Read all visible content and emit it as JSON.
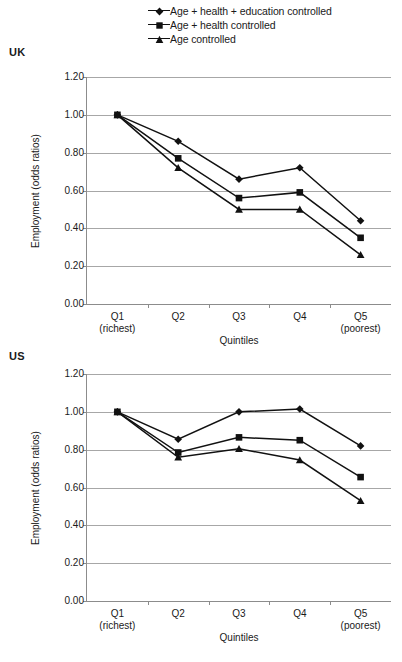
{
  "legend": {
    "position": "top-center",
    "items": [
      {
        "label": "Age + health + education controlled",
        "marker": "diamond-marker"
      },
      {
        "label": "Age + health controlled",
        "marker": "square-marker"
      },
      {
        "label": "Age controlled",
        "marker": "triangle-marker"
      }
    ]
  },
  "panels": [
    {
      "tag": "UK",
      "id": "uk"
    },
    {
      "tag": "US",
      "id": "us"
    }
  ],
  "axis": {
    "ylabel": "Employment (odds ratios)",
    "xlabel": "Quintiles",
    "yticks": [
      "1.20",
      "1.00",
      "0.80",
      "0.60",
      "0.40",
      "0.20",
      "0.00"
    ],
    "xticks": [
      {
        "main": "Q1",
        "sub": "(richest)"
      },
      {
        "main": "Q2",
        "sub": ""
      },
      {
        "main": "Q3",
        "sub": ""
      },
      {
        "main": "Q4",
        "sub": ""
      },
      {
        "main": "Q5",
        "sub": "(poorest)"
      }
    ]
  },
  "colors": {
    "line": "#111111",
    "grid": "#a7a7a7",
    "axis": "#8c8c8c",
    "text": "#1a1a1a"
  },
  "chart_data": [
    {
      "type": "line",
      "title": "UK",
      "xlabel": "Quintiles",
      "ylabel": "Employment (odds ratios)",
      "categories": [
        "Q1 (richest)",
        "Q2",
        "Q3",
        "Q4",
        "Q5 (poorest)"
      ],
      "ylim": [
        0.0,
        1.2
      ],
      "ytick_step": 0.2,
      "grid": "horizontal",
      "legend_position": "top-center",
      "series": [
        {
          "name": "Age + health + education controlled",
          "marker": "diamond",
          "values": [
            1.0,
            0.86,
            0.66,
            0.72,
            0.44
          ]
        },
        {
          "name": "Age + health controlled",
          "marker": "square",
          "values": [
            1.0,
            0.77,
            0.56,
            0.59,
            0.35
          ]
        },
        {
          "name": "Age controlled",
          "marker": "triangle",
          "values": [
            1.0,
            0.72,
            0.5,
            0.5,
            0.26
          ]
        }
      ]
    },
    {
      "type": "line",
      "title": "US",
      "xlabel": "Quintiles",
      "ylabel": "Employment (odds ratios)",
      "categories": [
        "Q1 (richest)",
        "Q2",
        "Q3",
        "Q4",
        "Q5 (poorest)"
      ],
      "ylim": [
        0.0,
        1.2
      ],
      "ytick_step": 0.2,
      "grid": "horizontal",
      "legend_position": "top-center",
      "series": [
        {
          "name": "Age + health + education controlled",
          "marker": "diamond",
          "values": [
            1.0,
            0.855,
            1.0,
            1.015,
            0.82
          ]
        },
        {
          "name": "Age + health controlled",
          "marker": "square",
          "values": [
            1.0,
            0.785,
            0.865,
            0.85,
            0.655
          ]
        },
        {
          "name": "Age controlled",
          "marker": "triangle",
          "values": [
            1.0,
            0.76,
            0.805,
            0.745,
            0.53
          ]
        }
      ]
    }
  ]
}
